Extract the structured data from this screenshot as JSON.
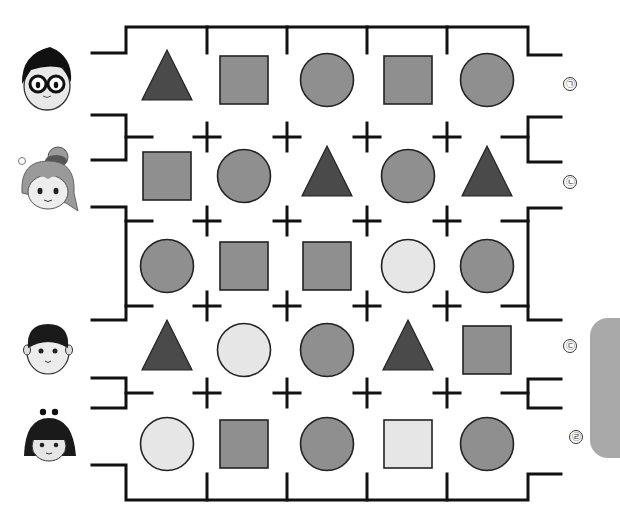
{
  "puzzle": {
    "colors": {
      "wall": "#111111",
      "dark": "#4a4a4a",
      "mid": "#8f8f8f",
      "light": "#e6e6e6",
      "outline": "#222222",
      "side_tab": "#a9a9a9"
    },
    "columns_x": [
      167,
      244,
      327,
      408,
      487
    ],
    "rows": [
      {
        "label": "㉠",
        "center_y": 80,
        "character": "boy-with-glasses",
        "shapes": [
          {
            "type": "triangle",
            "shade": "dark"
          },
          {
            "type": "square",
            "shade": "mid"
          },
          {
            "type": "circle",
            "shade": "mid"
          },
          {
            "type": "square",
            "shade": "mid"
          },
          {
            "type": "circle",
            "shade": "mid"
          }
        ]
      },
      {
        "label": "㉡",
        "center_y": 176,
        "character": "girl-with-bun",
        "shapes": [
          {
            "type": "square",
            "shade": "mid"
          },
          {
            "type": "circle",
            "shade": "mid"
          },
          {
            "type": "triangle",
            "shade": "dark"
          },
          {
            "type": "circle",
            "shade": "mid"
          },
          {
            "type": "triangle",
            "shade": "dark"
          }
        ]
      },
      {
        "label": "",
        "center_y": 266,
        "character": "",
        "shapes": [
          {
            "type": "circle",
            "shade": "mid"
          },
          {
            "type": "square",
            "shade": "mid"
          },
          {
            "type": "square",
            "shade": "mid"
          },
          {
            "type": "circle",
            "shade": "light"
          },
          {
            "type": "circle",
            "shade": "mid"
          }
        ]
      },
      {
        "label": "㉢",
        "center_y": 350,
        "character": "round-faced-boy",
        "shapes": [
          {
            "type": "triangle",
            "shade": "dark"
          },
          {
            "type": "circle",
            "shade": "light"
          },
          {
            "type": "circle",
            "shade": "mid"
          },
          {
            "type": "triangle",
            "shade": "dark"
          },
          {
            "type": "square",
            "shade": "mid"
          }
        ]
      },
      {
        "label": "㉣",
        "center_y": 444,
        "character": "girl-with-headband",
        "shapes": [
          {
            "type": "circle",
            "shade": "light"
          },
          {
            "type": "square",
            "shade": "mid"
          },
          {
            "type": "circle",
            "shade": "mid"
          },
          {
            "type": "square",
            "shade": "light"
          },
          {
            "type": "circle",
            "shade": "mid"
          }
        ]
      }
    ],
    "labels": [
      {
        "text": "㉠",
        "x": 563,
        "y": 77
      },
      {
        "text": "㉡",
        "x": 563,
        "y": 175
      },
      {
        "text": "㉢",
        "x": 563,
        "y": 339
      },
      {
        "text": "㉣",
        "x": 569,
        "y": 430
      }
    ],
    "faces": [
      {
        "name": "boy-with-glasses",
        "cx": 47,
        "cy": 82
      },
      {
        "name": "girl-with-bun",
        "cx": 48,
        "cy": 183
      },
      {
        "name": "round-faced-boy",
        "cx": 48,
        "cy": 346
      },
      {
        "name": "girl-with-headband",
        "cx": 49,
        "cy": 438
      }
    ],
    "separators_y": [
      137,
      221,
      306,
      393
    ],
    "cross_x": [
      207,
      287,
      367,
      447
    ]
  }
}
